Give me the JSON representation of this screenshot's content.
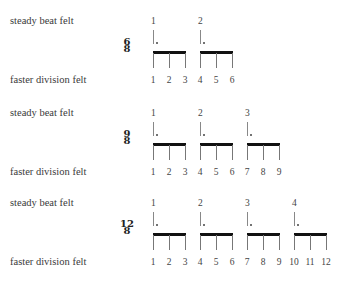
{
  "rows": [
    {
      "id": "six-eight",
      "top_label": "steady beat felt",
      "bottom_label": "faster division felt",
      "time_signature": {
        "numerator": "6",
        "denominator": "8"
      },
      "beats": [
        "1",
        "2"
      ],
      "divisions": [
        "1",
        "2",
        "3",
        "4",
        "5",
        "6"
      ]
    },
    {
      "id": "nine-eight",
      "top_label": "steady beat felt",
      "bottom_label": "faster division felt",
      "time_signature": {
        "numerator": "9",
        "denominator": "8"
      },
      "beats": [
        "1",
        "2",
        "3"
      ],
      "divisions": [
        "1",
        "2",
        "3",
        "4",
        "5",
        "6",
        "7",
        "8",
        "9"
      ]
    },
    {
      "id": "twelve-eight",
      "top_label": "steady beat felt",
      "bottom_label": "faster division felt",
      "time_signature": {
        "numerator": "12",
        "denominator": "8"
      },
      "beats": [
        "1",
        "2",
        "3",
        "4"
      ],
      "divisions": [
        "1",
        "2",
        "3",
        "4",
        "5",
        "6",
        "7",
        "8",
        "9",
        "10",
        "11",
        "12"
      ]
    }
  ]
}
